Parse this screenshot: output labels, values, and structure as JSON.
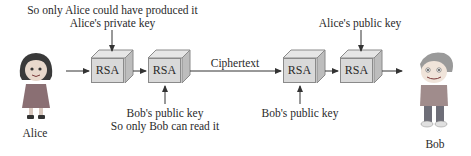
{
  "diagram": {
    "boxes": [
      {
        "label": "RSA"
      },
      {
        "label": "RSA"
      },
      {
        "label": "RSA"
      },
      {
        "label": "RSA"
      }
    ],
    "labels": {
      "top_left_line1": "So only Alice could have produced it",
      "top_left_line2": "Alice's private key",
      "bottom_left_line1": "Bob's public key",
      "bottom_left_line2": "So only Bob can read it",
      "ciphertext": "Ciphertext",
      "bottom_right": "Bob's public key",
      "top_right": "Alice's public key"
    },
    "actors": {
      "sender": "Alice",
      "receiver": "Bob"
    },
    "colors": {
      "box_fill": "#d9d9d9",
      "box_top": "#e6e6e6",
      "box_side": "#bdbdbd",
      "line": "#333333"
    }
  }
}
